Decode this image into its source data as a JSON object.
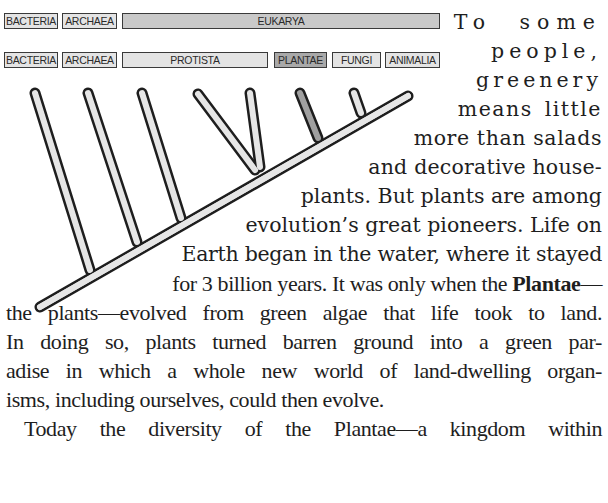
{
  "diagram": {
    "top_row": [
      {
        "label": "BACTERIA"
      },
      {
        "label": "ARCHAEA"
      },
      {
        "label": "EUKARYA"
      }
    ],
    "bottom_row": [
      {
        "label": "BACTERIA"
      },
      {
        "label": "ARCHAEA"
      },
      {
        "label": "PROTISTA"
      },
      {
        "label": "PLANTAE",
        "highlighted": true
      },
      {
        "label": "FUNGI"
      },
      {
        "label": "ANIMALIA"
      }
    ],
    "colors": {
      "label_fill": "#e4e4e4",
      "eukarya_fill": "#c9c9c9",
      "plantae_fill": "#a9a9a9",
      "branch_fill": "#e6e6e6",
      "plantae_branch_fill": "#a0a0a0",
      "outline": "#1e1e1e"
    }
  },
  "body_text": {
    "lines": [
      "To some",
      "people,",
      "greenery",
      "means little",
      "more than salads",
      "and decorative house-",
      "plants. But plants are among",
      "evolution’s great pioneers. Life on",
      "Earth began in the water, where it stayed",
      "for 3 billion years. It was only when the",
      "Plantae",
      "—",
      "the plants—evolved from green algae that life took to land.",
      "In doing so, plants turned barren ground into a green par-",
      "adise in which a whole new world of land-dwelling organ-",
      "isms, including ourselves, could then evolve.",
      "Today the diversity of the Plantae—a kingdom within"
    ]
  }
}
